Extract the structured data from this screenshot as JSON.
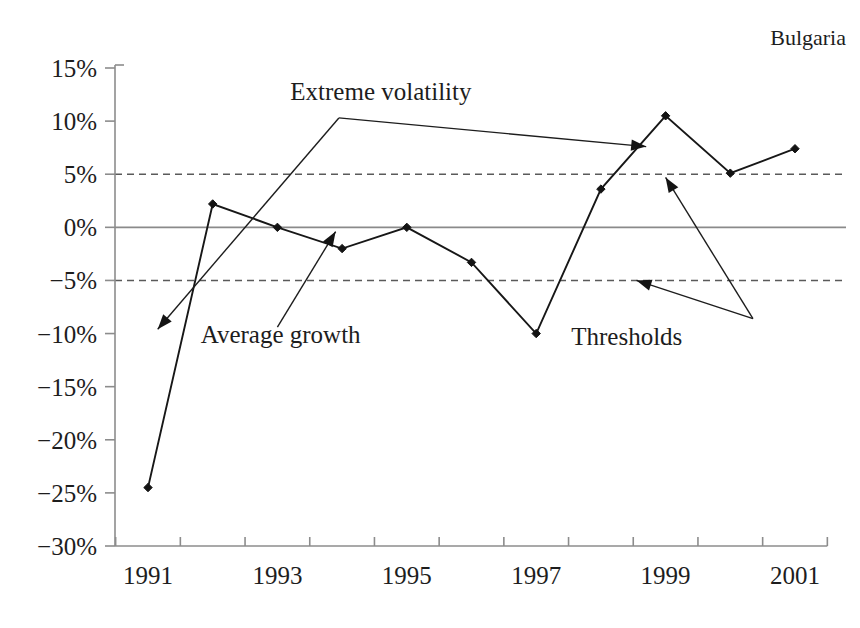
{
  "chart_data": {
    "type": "line",
    "title": "",
    "country_label": "Bulgaria",
    "xlabel": "",
    "ylabel": "",
    "x": [
      1991,
      1992,
      1993,
      1994,
      1995,
      1996,
      1997,
      1998,
      1999,
      2000,
      2001
    ],
    "xtick_labels": [
      "1991",
      "1993",
      "1995",
      "1997",
      "1999",
      "2001"
    ],
    "xtick_values": [
      1991,
      1993,
      1995,
      1997,
      1999,
      2001
    ],
    "xlim": [
      1990.5,
      2001.5
    ],
    "ytick_labels": [
      "15%",
      "10%",
      "5%",
      "0%",
      "-5%",
      "-10%",
      "-15%",
      "-20%",
      "-25%",
      "-30%"
    ],
    "ytick_values": [
      15,
      10,
      5,
      0,
      -5,
      -10,
      -15,
      -20,
      -25,
      -30
    ],
    "ylim": [
      -30,
      15
    ],
    "grid": false,
    "legend_position": "none",
    "series": [
      {
        "name": "Average growth",
        "values": [
          -24.5,
          2.2,
          0.0,
          -2.0,
          0.0,
          -3.3,
          -10.0,
          3.6,
          10.5,
          5.1,
          7.4
        ],
        "marker": "diamond",
        "color": "#171717"
      }
    ],
    "reference_lines": [
      {
        "name": "zero-line",
        "value": 0,
        "style": "solid",
        "color": "#8a8a8a"
      },
      {
        "name": "upper-threshold",
        "value": 5,
        "style": "dashed",
        "color": "#5a5a5a"
      },
      {
        "name": "lower-threshold",
        "value": -5,
        "style": "dashed",
        "color": "#5a5a5a"
      }
    ],
    "annotations": [
      {
        "id": "extreme-volatility",
        "label": "Extreme volatility",
        "text_x": 1994.6,
        "text_y": 12.0,
        "arrows": [
          {
            "from_x": 1993.95,
            "from_y": 10.3,
            "to_x": 1991.15,
            "to_y": -9.6
          },
          {
            "from_x": 1993.95,
            "from_y": 10.3,
            "to_x": 1998.7,
            "to_y": 7.6
          }
        ]
      },
      {
        "id": "average-growth",
        "label": "Average growth",
        "text_x": 1993.05,
        "text_y": -10.9,
        "arrows": [
          {
            "from_x": 1993.0,
            "from_y": -9.4,
            "to_x": 1993.9,
            "to_y": -0.4
          }
        ]
      },
      {
        "id": "thresholds",
        "label": "Thresholds",
        "text_x": 1998.4,
        "text_y": -11.1,
        "arrows": [
          {
            "from_x": 2000.35,
            "from_y": -8.6,
            "to_x": 1999.0,
            "to_y": 4.7
          },
          {
            "from_x": 2000.35,
            "from_y": -8.6,
            "to_x": 1998.55,
            "to_y": -5.0
          }
        ]
      }
    ]
  }
}
